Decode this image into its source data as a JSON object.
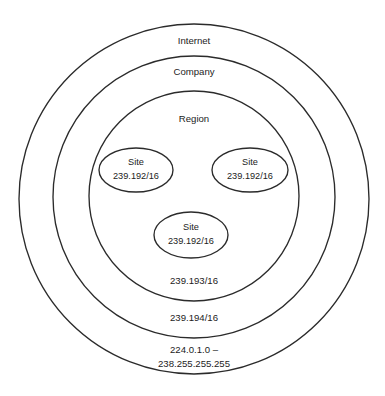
{
  "diagram": {
    "type": "nested-scope-venn",
    "background_color": "#ffffff",
    "line_color": "#2b2b2b",
    "text_color": "#1c1c1c",
    "rings": [
      {
        "id": "internet",
        "name": "Internet",
        "range": "224.0.1.0 –",
        "range_line2": "238.255.255.255",
        "cx": 194,
        "cy": 199,
        "r": 175
      },
      {
        "id": "company",
        "name": "Company",
        "range": "239.194/16",
        "cx": 194,
        "cy": 197,
        "r": 141
      },
      {
        "id": "region",
        "name": "Region",
        "range": "239.193/16",
        "cx": 194,
        "cy": 196,
        "r": 105
      }
    ],
    "sites": [
      {
        "id": "site-left",
        "name": "Site",
        "address": "239.192/16",
        "cx": 136,
        "cy": 170,
        "rx": 37,
        "ry": 22
      },
      {
        "id": "site-right",
        "name": "Site",
        "address": "239.192/16",
        "cx": 250,
        "cy": 170,
        "rx": 38,
        "ry": 22
      },
      {
        "id": "site-bottom",
        "name": "Site",
        "address": "239.192/16",
        "cx": 191,
        "cy": 235,
        "rx": 37,
        "ry": 23
      }
    ]
  }
}
